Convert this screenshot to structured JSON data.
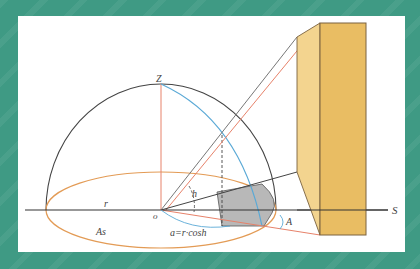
{
  "diagram": {
    "type": "sun-altitude shadow geometry",
    "labels": {
      "zenith": "Z",
      "origin": "o",
      "radius": "r",
      "altitude": "h",
      "azimuth": "A",
      "south": "S",
      "shadow_area": "As",
      "formula": "a=r·cosh"
    },
    "colors": {
      "background": "#3f9a84",
      "panel": "#ffffff",
      "hemisphere": "#444444",
      "orbit_ellipse": "#e39b55",
      "sun_path": "#5aa9d6",
      "ray_orange": "#e7826a",
      "shadow_fill": "#b8b8b8",
      "box_front": "#e9bd63",
      "box_side": "#f3d48f",
      "box_edge": "#7a6240"
    }
  }
}
